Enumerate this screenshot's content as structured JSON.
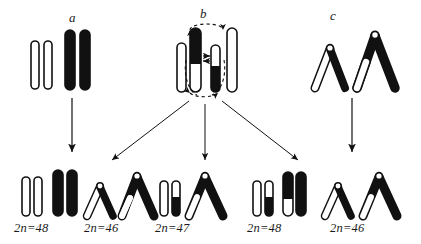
{
  "figure": {
    "kind": "diagram",
    "colors": {
      "ink": "#111111",
      "fill_black": "#111111",
      "fill_white": "#ffffff",
      "page": "#ffffff"
    }
  },
  "groups": [
    {
      "id": "a",
      "label": "a",
      "x": 72,
      "y": 16
    },
    {
      "id": "b",
      "label": "b",
      "x": 202,
      "y": 12
    },
    {
      "id": "c",
      "label": "c",
      "x": 332,
      "y": 14
    }
  ],
  "parents": {
    "a": {
      "name": "parent-a-rods",
      "rods": [
        {
          "name": "rod-white-1",
          "x": 32,
          "y": 40,
          "w": 7,
          "h": 49,
          "fill": "white",
          "black_from": 0,
          "black_to": 0
        },
        {
          "name": "rod-white-2",
          "x": 45,
          "y": 40,
          "w": 7,
          "h": 49,
          "fill": "white",
          "black_from": 0,
          "black_to": 0
        },
        {
          "name": "rod-black-1",
          "x": 66,
          "y": 30,
          "w": 9,
          "h": 60,
          "fill": "black",
          "black_from": 0,
          "black_to": 1
        },
        {
          "name": "rod-black-2",
          "x": 80,
          "y": 30,
          "w": 9,
          "h": 60,
          "fill": "black",
          "black_from": 0,
          "black_to": 1
        }
      ]
    },
    "b": {
      "name": "parent-b-rods",
      "annotation": {
        "name": "pairing-ellipse",
        "style": "dashed",
        "arrowheads": 4
      },
      "exchange_marks": {
        "name": "exchange-arrows",
        "count": 2,
        "x": 205,
        "y": 58
      },
      "rods": [
        {
          "name": "rod-white-outer-left",
          "x": 178,
          "y": 42,
          "w": 8,
          "h": 50,
          "fill": "white"
        },
        {
          "name": "rod-black-top-inner-left",
          "x": 191,
          "y": 28,
          "w": 9,
          "h": 64,
          "fill": "half",
          "black_from": 0.0,
          "black_to": 0.55
        },
        {
          "name": "rod-black-bottom-inner-right",
          "x": 212,
          "y": 44,
          "w": 8,
          "h": 48,
          "fill": "half",
          "black_from": 0.5,
          "black_to": 1.0
        },
        {
          "name": "rod-white-outer-right",
          "x": 227,
          "y": 28,
          "w": 9,
          "h": 64,
          "fill": "white"
        }
      ]
    },
    "c": {
      "name": "parent-c-chevrons",
      "chevrons": [
        {
          "name": "chevron-small-white",
          "cx": 330,
          "apex_y": 46,
          "span": 34,
          "height": 36,
          "left_fill": "white",
          "right_fill": "black"
        },
        {
          "name": "chevron-large-black",
          "cx": 375,
          "apex_y": 34,
          "span": 44,
          "height": 50,
          "left_fill": "half-white",
          "right_fill": "black"
        }
      ]
    }
  },
  "arrows": [
    {
      "name": "arrow-a-down",
      "from": [
        72,
        96
      ],
      "to": [
        72,
        152
      ],
      "style": "solid"
    },
    {
      "name": "arrow-b-to-left-offspring",
      "from": [
        192,
        100
      ],
      "to": [
        110,
        160
      ],
      "style": "solid"
    },
    {
      "name": "arrow-b-to-middle-offspring",
      "from": [
        205,
        102
      ],
      "to": [
        205,
        160
      ],
      "style": "solid"
    },
    {
      "name": "arrow-b-to-right-offspring",
      "from": [
        222,
        100
      ],
      "to": [
        300,
        160
      ],
      "style": "solid"
    },
    {
      "name": "arrow-c-down",
      "from": [
        352,
        96
      ],
      "to": [
        352,
        152
      ],
      "style": "solid"
    }
  ],
  "offspring": [
    {
      "id": "o1",
      "name": "offspring-group-1",
      "karyotype": "2n=48",
      "label_x": 14,
      "label_y": 222,
      "type": "rods",
      "rods": [
        {
          "name": "rod-white-1",
          "x": 22,
          "y": 176,
          "w": 7,
          "h": 40,
          "fill": "white"
        },
        {
          "name": "rod-white-2",
          "x": 34,
          "y": 176,
          "w": 7,
          "h": 40,
          "fill": "white"
        },
        {
          "name": "rod-black-1",
          "x": 53,
          "y": 170,
          "w": 9,
          "h": 46,
          "fill": "black"
        },
        {
          "name": "rod-black-2",
          "x": 66,
          "y": 170,
          "w": 9,
          "h": 46,
          "fill": "black"
        }
      ]
    },
    {
      "id": "o2",
      "name": "offspring-group-2",
      "karyotype": "2n=46",
      "label_x": 84,
      "label_y": 222,
      "type": "chevrons",
      "chevrons": [
        {
          "name": "chevron-small-white",
          "cx": 100,
          "apex_y": 184,
          "span": 30,
          "height": 32,
          "left_fill": "white",
          "right_fill": "black"
        },
        {
          "name": "chevron-large-black",
          "cx": 136,
          "apex_y": 176,
          "span": 38,
          "height": 40,
          "left_fill": "half-white",
          "right_fill": "black"
        }
      ]
    },
    {
      "id": "o3",
      "name": "offspring-group-3",
      "karyotype": "2n=47",
      "label_x": 155,
      "label_y": 222,
      "type": "mixed",
      "rods": [
        {
          "name": "rod-white-1",
          "x": 160,
          "y": 180,
          "w": 7,
          "h": 36,
          "fill": "white"
        },
        {
          "name": "rod-half-black-bottom",
          "x": 172,
          "y": 180,
          "w": 7,
          "h": 36,
          "fill": "half",
          "black_from": 0.45,
          "black_to": 1.0
        }
      ],
      "chevrons": [
        {
          "name": "chevron-large-black",
          "cx": 203,
          "apex_y": 176,
          "span": 40,
          "height": 40,
          "left_fill": "half-white",
          "right_fill": "black"
        }
      ]
    },
    {
      "id": "o4",
      "name": "offspring-group-4",
      "karyotype": "2n=48",
      "label_x": 247,
      "label_y": 222,
      "type": "rods",
      "rods": [
        {
          "name": "rod-white-1",
          "x": 253,
          "y": 180,
          "w": 7,
          "h": 36,
          "fill": "white"
        },
        {
          "name": "rod-half-black-bottom",
          "x": 265,
          "y": 180,
          "w": 7,
          "h": 36,
          "fill": "half",
          "black_from": 0.45,
          "black_to": 1.0
        },
        {
          "name": "rod-black-lower-white-tip",
          "x": 283,
          "y": 172,
          "w": 9,
          "h": 44,
          "fill": "half",
          "black_from": 0.0,
          "black_to": 0.62
        },
        {
          "name": "rod-black-full",
          "x": 296,
          "y": 172,
          "w": 9,
          "h": 44,
          "fill": "black"
        }
      ]
    },
    {
      "id": "o5",
      "name": "offspring-group-5",
      "karyotype": "2n=46",
      "label_x": 330,
      "label_y": 222,
      "type": "chevrons",
      "chevrons": [
        {
          "name": "chevron-small-white",
          "cx": 338,
          "apex_y": 184,
          "span": 30,
          "height": 32,
          "left_fill": "white",
          "right_fill": "black"
        },
        {
          "name": "chevron-large-black",
          "cx": 378,
          "apex_y": 176,
          "span": 40,
          "height": 40,
          "left_fill": "half-white",
          "right_fill": "black"
        }
      ]
    }
  ]
}
